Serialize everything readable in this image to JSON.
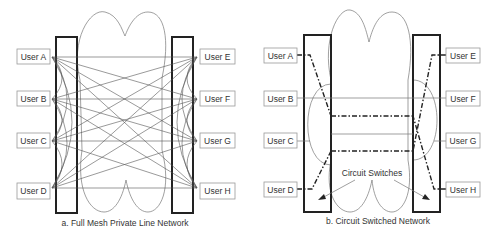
{
  "panel_a": {
    "caption": "a.  Full Mesh Private Line Network",
    "left_users": [
      "User A",
      "User B",
      "User C",
      "User D"
    ],
    "right_users": [
      "User E",
      "User F",
      "User G",
      "User H"
    ]
  },
  "panel_b": {
    "caption": "b.  Circuit Switched Network",
    "left_users": [
      "User A",
      "User B",
      "User C",
      "User D"
    ],
    "right_users": [
      "User E",
      "User F",
      "User G",
      "User H"
    ],
    "annotation": "Circuit Switches"
  }
}
